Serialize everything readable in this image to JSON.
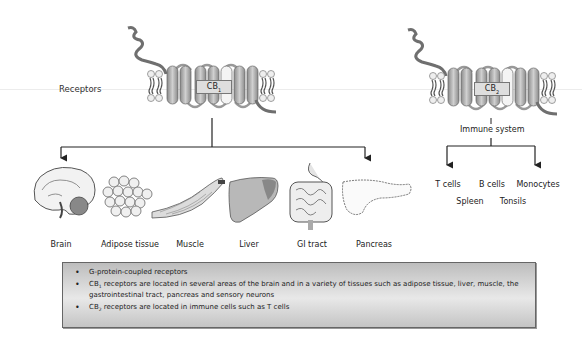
{
  "receptors_label": "Receptors",
  "cb1": {
    "prefix": "CB",
    "sub": "1"
  },
  "cb2": {
    "prefix": "CB",
    "sub": "2"
  },
  "cb2_target": "Immune system",
  "cb1_tissues": [
    {
      "name": "Brain",
      "icon": "brain-icon"
    },
    {
      "name": "Adipose tissue",
      "icon": "adipose-icon"
    },
    {
      "name": "Muscle",
      "icon": "muscle-icon"
    },
    {
      "name": "Liver",
      "icon": "liver-icon"
    },
    {
      "name": "GI tract",
      "icon": "gi-tract-icon"
    },
    {
      "name": "Pancreas",
      "icon": "pancreas-icon"
    }
  ],
  "immune_cells": {
    "row1": [
      "T cells",
      "B cells",
      "Monocytes"
    ],
    "row2": [
      "Spleen",
      "Tonsils"
    ]
  },
  "info": {
    "bullet1": "G-protein-coupled receptors",
    "bullet2_prefix": "CB",
    "bullet2_sub": "1",
    "bullet2_text": " receptors are located in several areas of the brain and in a variety of tissues such as adipose tissue, liver, muscle, the gastrointestinal tract, pancreas and sensory neurons",
    "bullet3_prefix": "CB",
    "bullet3_sub": "2",
    "bullet3_text": " receptors are located in immune cells such as T cells"
  },
  "colors": {
    "helix": "#a8a8a8",
    "helix_dark": "#7a7a7a",
    "tail": "#6f6f6f",
    "liver": "#9a9a9a",
    "box_bg": "#dcdcdc"
  }
}
